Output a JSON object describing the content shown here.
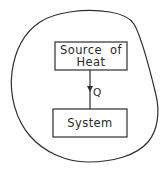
{
  "diagram": {
    "colors": {
      "stroke": "#2e2e2e",
      "background": "#ffffff",
      "text": "#2a2a2a"
    },
    "boundary": {
      "shape": "closed-irregular-blob",
      "description": "surroundings enclosing source and system"
    },
    "source_box": {
      "line1": "Source  of",
      "line2": "Heat"
    },
    "system_box": {
      "label": "System"
    },
    "heat_flow": {
      "label": "Q",
      "direction": "down",
      "from": "Source of Heat",
      "to": "System"
    }
  }
}
